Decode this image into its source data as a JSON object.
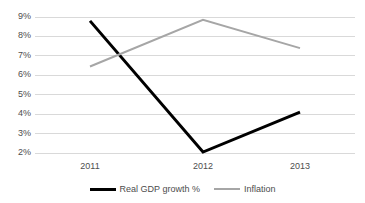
{
  "chart_data": {
    "type": "line",
    "title": "",
    "xlabel": "",
    "ylabel": "",
    "categories": [
      "2011",
      "2012",
      "2013"
    ],
    "series": [
      {
        "name": "Real GDP growth %",
        "values": [
          8.8,
          2.05,
          4.1
        ],
        "color": "#000000",
        "line_width": 3
      },
      {
        "name": "Inflation",
        "values": [
          6.45,
          8.85,
          7.4
        ],
        "color": "#a6a6a6",
        "line_width": 2
      }
    ],
    "ylim": [
      2,
      9
    ],
    "ytick_labels": [
      "9%",
      "8%",
      "7%",
      "6%",
      "5%",
      "4%",
      "3%",
      "2%"
    ],
    "ytick_values": [
      9,
      8,
      7,
      6,
      5,
      4,
      3,
      2
    ],
    "grid": true,
    "grid_color": "#d9d9d9",
    "legend_position": "bottom",
    "background": "#ffffff"
  }
}
